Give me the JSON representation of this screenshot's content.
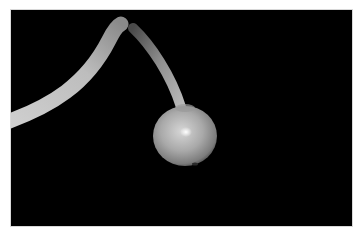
{
  "image": {
    "caption": "Small round fruit hanging from a curved stalk on a black background",
    "border_color": "#ffffff",
    "background_color": "#000000",
    "subject": {
      "fruit": {
        "shape": "round",
        "tone": "grey-green",
        "highlight": "specular spot near center"
      },
      "stem": {
        "shape": "arched",
        "enters_from": "left edge",
        "connects_to": "top of fruit"
      }
    }
  }
}
